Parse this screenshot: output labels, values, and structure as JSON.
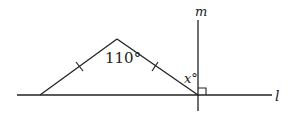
{
  "diagram": {
    "lines": {
      "horizontal_label": "l",
      "vertical_label": "m"
    },
    "angles": {
      "apex": "110°",
      "unknown": "x°"
    },
    "markers": {
      "congruent_ticks": 2,
      "right_angle": true
    },
    "colors": {
      "stroke": "#222222",
      "background": "#ffffff"
    }
  }
}
